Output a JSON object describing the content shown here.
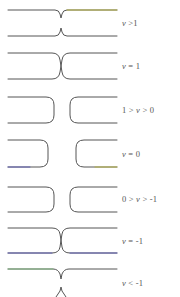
{
  "figure": {
    "line_color": "#555555",
    "accent_colors": {
      "yellow_segment": "#b8b43a",
      "blue_segment": "#5a5ab8",
      "green_segment": "#7ab87a"
    },
    "panels": [
      {
        "id": "v-gt-1",
        "label": "v >1",
        "shape": "cusp-pinch",
        "top_y": 10,
        "bottom_y": 36
      },
      {
        "id": "v-eq-1",
        "label": "v = 1",
        "shape": "touching",
        "top_y": 53,
        "bottom_y": 79
      },
      {
        "id": "v-1-to-0",
        "label": "1 > v > 0",
        "shape": "separated",
        "top_y": 97,
        "bottom_y": 123
      },
      {
        "id": "v-eq-0",
        "label": "v = 0",
        "shape": "wide-gap",
        "top_y": 140,
        "bottom_y": 167
      },
      {
        "id": "v-0-to-neg1",
        "label": "0 > v > -1",
        "shape": "separated",
        "top_y": 187,
        "bottom_y": 212
      },
      {
        "id": "v-eq-neg1",
        "label": "v = -1",
        "shape": "touching",
        "top_y": 228,
        "bottom_y": 253
      },
      {
        "id": "v-lt-neg1",
        "label": "v < -1",
        "shape": "cusp-pinch",
        "top_y": 269,
        "bottom_y": 291
      }
    ]
  }
}
